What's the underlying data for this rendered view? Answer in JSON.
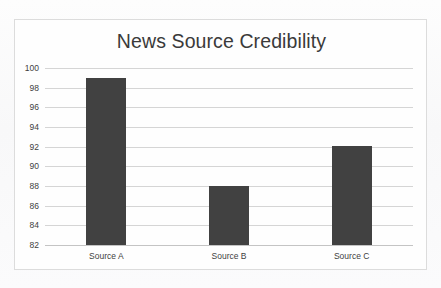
{
  "chart_data": {
    "type": "bar",
    "title": "News Source Credibility",
    "xlabel": "",
    "ylabel": "",
    "categories": [
      "Source A",
      "Source B",
      "Source C"
    ],
    "values": [
      99.0,
      88.0,
      92.1
    ],
    "ylim": [
      82,
      100
    ],
    "yticks": [
      100,
      98,
      96,
      94,
      92,
      90,
      88,
      86,
      84,
      82
    ],
    "ytick_labels": [
      "100",
      "98",
      "96",
      "94",
      "92",
      "90",
      "88",
      "86",
      "84",
      "82"
    ],
    "grid": true,
    "legend": false,
    "legend_position": "none",
    "bar_color": "#414141",
    "gridline_color": "#d5d5d5",
    "title_color": "#3a3a3a",
    "tick_label_color": "#3f3f3f",
    "border_color": "#dcdcdc",
    "plot_background": "#fefefe"
  }
}
